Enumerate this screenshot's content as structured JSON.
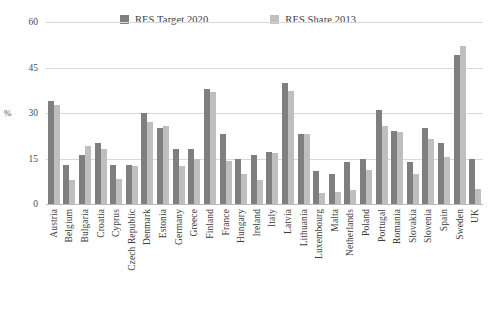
{
  "chart_data": {
    "type": "bar",
    "title": "",
    "xlabel": "",
    "ylabel": "%",
    "ylim": [
      0,
      60
    ],
    "yticks": [
      0,
      15,
      30,
      45,
      60
    ],
    "ytick_labels": [
      "0",
      "15",
      "30",
      "45",
      "60"
    ],
    "grid": true,
    "legend_position": "top-center",
    "categories": [
      "Austria",
      "Belgium",
      "Bulgaria",
      "Croatia",
      "Cyprus",
      "Czech Republic",
      "Denmark",
      "Estonia",
      "Germany",
      "Greece",
      "Finland",
      "France",
      "Hungary",
      "Ireland",
      "Italy",
      "Latvia",
      "Lithuania",
      "Luxembourg",
      "Malta",
      "Netherlands",
      "Poland",
      "Portugal",
      "Romania",
      "Slovakia",
      "Slovenia",
      "Spain",
      "Sweden",
      "UK"
    ],
    "series": [
      {
        "name": "RES Target 2020",
        "color": "#7f7f7f",
        "values": [
          34.0,
          13.0,
          16.0,
          20.0,
          13.0,
          13.0,
          30.0,
          25.0,
          18.0,
          18.0,
          38.0,
          23.0,
          14.9,
          16.0,
          17.0,
          40.0,
          23.0,
          11.0,
          10.0,
          14.0,
          15.0,
          31.0,
          24.0,
          14.0,
          25.0,
          20.0,
          49.0,
          15.0
        ]
      },
      {
        "name": "RES Share 2013",
        "color": "#bfbfbf",
        "values": [
          32.6,
          7.9,
          19.0,
          18.0,
          8.1,
          12.4,
          27.2,
          25.6,
          12.4,
          15.0,
          36.8,
          14.2,
          9.8,
          7.8,
          16.7,
          37.1,
          23.0,
          3.6,
          3.8,
          4.5,
          11.3,
          25.7,
          23.9,
          9.8,
          21.5,
          15.4,
          52.1,
          5.1
        ]
      }
    ]
  },
  "legend": {
    "entries": [
      {
        "label": "RES Target 2020",
        "color": "#7f7f7f",
        "swatch": "legend-swatch-dark"
      },
      {
        "label": "RES Share 2013",
        "color": "#bfbfbf",
        "swatch": "legend-swatch-light"
      }
    ]
  },
  "axis": {
    "y_title": "%"
  }
}
